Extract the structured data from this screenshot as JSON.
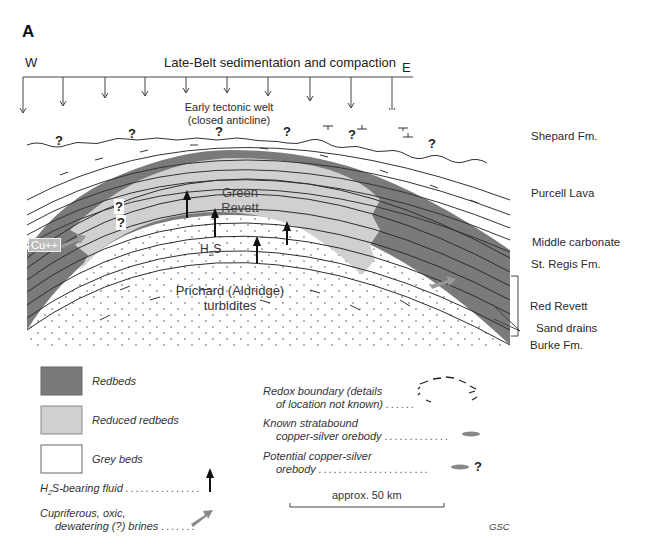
{
  "panel_letter": "A",
  "title": "Late-Belt sedimentation and compaction",
  "direction": {
    "west": "W",
    "east": "E"
  },
  "annotations": {
    "tectonic_welt_line1": "Early tectonic welt",
    "tectonic_welt_line2": "(closed anticline)",
    "green_revett_line1": "Green",
    "green_revett_line2": "Revett",
    "h2s_base": "H",
    "h2s_sub": "2",
    "h2s_tail": "S",
    "prichard_line1": "Prichard (Aldridge)",
    "prichard_line2": "turbidites",
    "cu": "Cu++",
    "question_mark": "?"
  },
  "formations": [
    {
      "label": "Shepard Fm."
    },
    {
      "label": "Purcell Lava"
    },
    {
      "label": "Middle carbonate"
    },
    {
      "label": "St. Regis Fm."
    },
    {
      "label": "Red Revett"
    },
    {
      "label": "Sand drains"
    },
    {
      "label": "Burke Fm."
    }
  ],
  "legend": {
    "left": [
      {
        "label": "Redbeds",
        "color": "#7a7a7a"
      },
      {
        "label": "Reduced redbeds",
        "color": "#d0d0d0"
      },
      {
        "label": "Grey beds",
        "color": "#ffffff"
      }
    ],
    "h2s_fluid": {
      "pre": "H",
      "sub": "2",
      "post": "S-bearing fluid",
      "dots": "..............."
    },
    "brines": {
      "line1": "Cupriferous, oxic,",
      "line2": "dewatering (?) brines",
      "dots": "......."
    },
    "right": [
      {
        "line1": "Redox boundary (details",
        "line2": "of location not known)",
        "dots": "......"
      },
      {
        "line1": "Known stratabound",
        "line2": "copper-silver orebody",
        "dots": "............."
      },
      {
        "line1": "Potential copper-silver",
        "line2": "orebody",
        "dots": "......................",
        "suffix": "?"
      }
    ]
  },
  "scale_bar": {
    "label": "approx. 50 km"
  },
  "credit": "GSC",
  "colors": {
    "redbeds": "#7a7a7a",
    "reduced_redbeds": "#d0d0d0",
    "grey_beds": "#ffffff",
    "line": "#333333",
    "arrow": "#111111",
    "brine_arrow": "#8a8a8a"
  }
}
